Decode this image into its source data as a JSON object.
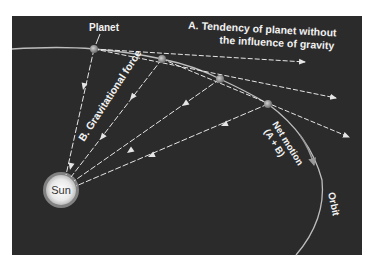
{
  "diagram": {
    "labels": {
      "planet": "Planet",
      "tendency_line1": "A. Tendency of planet without",
      "tendency_line2": "the influence of gravity",
      "gravity": "B. Gravitational force",
      "net_line1": "Net motion",
      "net_line2": "(A + B)",
      "orbit": "Orbit",
      "sun": "Sun"
    },
    "colors": {
      "background": "#2b2b2b",
      "lines": "#e6e6e6",
      "orbit": "#bdbdbd",
      "sun": "#f0f0f0",
      "planet": "#8a8a8a"
    },
    "planets": [
      {
        "x": 94,
        "y": 49
      },
      {
        "x": 162,
        "y": 59
      },
      {
        "x": 220,
        "y": 79
      },
      {
        "x": 268,
        "y": 104
      }
    ],
    "sun": {
      "x": 61,
      "y": 190,
      "r": 16
    }
  }
}
